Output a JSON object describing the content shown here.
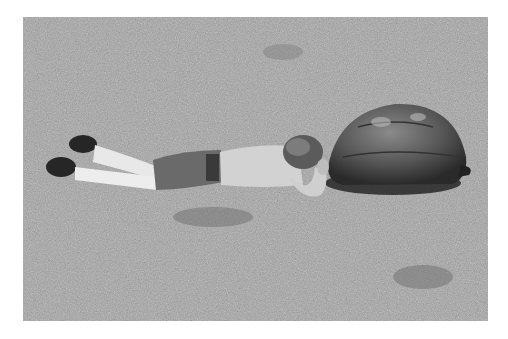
{
  "image": {
    "kind": "black-and-white photograph",
    "border_color": "#ffffff",
    "subject": "person lying prone on grass face-to-face with a giant tortoise",
    "elements": [
      "grass-field",
      "person",
      "tortoise"
    ]
  }
}
